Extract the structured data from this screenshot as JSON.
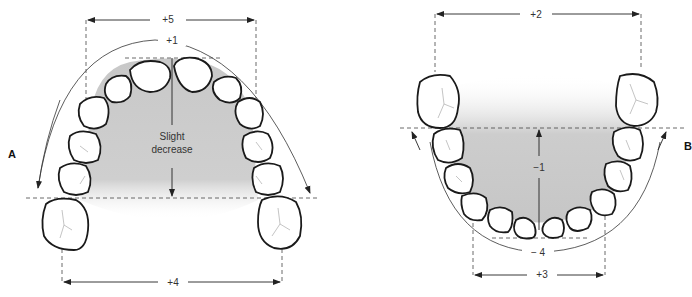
{
  "figure": {
    "panels": [
      {
        "id": "A",
        "label": "A",
        "arch": "maxillary",
        "measurements": {
          "intercanine_width_top": "+5",
          "arch_perimeter": "+1",
          "arch_depth": "Slight decrease",
          "arch_depth_line1": "Slight",
          "arch_depth_line2": "decrease",
          "intermolar_width": "+4"
        }
      },
      {
        "id": "B",
        "label": "B",
        "arch": "mandibular",
        "measurements": {
          "intermolar_width": "+2",
          "arch_depth": "−1",
          "arch_perimeter": "− 4",
          "intercanine_width": "+3"
        }
      }
    ],
    "colors": {
      "palate_shading": "#c8c8c8",
      "tooth_outline": "#1a1a1a",
      "line": "#333333"
    }
  }
}
